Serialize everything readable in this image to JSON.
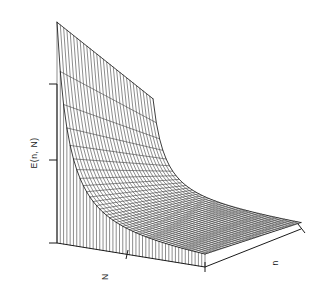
{
  "figure": {
    "title": "",
    "background_color": "#ffffff",
    "line_color": "#1a1a1a"
  },
  "labels": {
    "y_axis": "E(n, N)",
    "x_axis_left": "N",
    "x_axis_right": "n",
    "orientation_note": "rotated"
  },
  "chart_data": {
    "type": "line",
    "subtype": "3d-wireframe-surface",
    "title": "",
    "xlabel": "N",
    "ylabel": "E(n, N)",
    "zlabel": "n",
    "grid": false,
    "legend": "none",
    "axis_ticks": {
      "vertical_axis_ticks": 3,
      "N_axis_ticks": 3,
      "n_axis_ticks": 2
    },
    "surface_description": "Energy surface E(n, N) diverging steeply at small N and decaying to a flat valley at large N; monotone gentle variation along n.",
    "x": [
      1,
      2,
      3,
      4,
      5,
      6,
      7,
      8,
      9,
      10,
      11,
      12,
      13,
      14,
      15,
      16,
      17,
      18,
      19,
      20,
      21,
      22,
      23,
      24,
      25,
      26,
      27,
      28,
      29,
      30
    ],
    "z": [
      1,
      2,
      3,
      4,
      5,
      6,
      7,
      8,
      9,
      10,
      11,
      12,
      13,
      14,
      15,
      16,
      17,
      18,
      19,
      20
    ],
    "series": [
      {
        "name": "n=1",
        "values": [
          1.0,
          0.46,
          0.28,
          0.2,
          0.15,
          0.12,
          0.1,
          0.085,
          0.074,
          0.065,
          0.058,
          0.052,
          0.047,
          0.043,
          0.04,
          0.037,
          0.034,
          0.032,
          0.03,
          0.028,
          0.027,
          0.025,
          0.024,
          0.023,
          0.022,
          0.021,
          0.02,
          0.019,
          0.018,
          0.018
        ]
      },
      {
        "name": "n=5",
        "values": [
          0.86,
          0.4,
          0.24,
          0.17,
          0.13,
          0.105,
          0.087,
          0.074,
          0.064,
          0.056,
          0.05,
          0.045,
          0.041,
          0.037,
          0.034,
          0.032,
          0.03,
          0.028,
          0.026,
          0.024,
          0.023,
          0.022,
          0.021,
          0.02,
          0.019,
          0.018,
          0.017,
          0.017,
          0.016,
          0.015
        ]
      },
      {
        "name": "n=10",
        "values": [
          0.7,
          0.33,
          0.2,
          0.14,
          0.11,
          0.087,
          0.072,
          0.061,
          0.053,
          0.046,
          0.041,
          0.037,
          0.034,
          0.031,
          0.028,
          0.026,
          0.025,
          0.023,
          0.022,
          0.02,
          0.019,
          0.018,
          0.017,
          0.017,
          0.016,
          0.015,
          0.014,
          0.014,
          0.013,
          0.013
        ]
      },
      {
        "name": "n=15",
        "values": [
          0.55,
          0.26,
          0.16,
          0.11,
          0.086,
          0.069,
          0.057,
          0.049,
          0.042,
          0.037,
          0.033,
          0.03,
          0.027,
          0.025,
          0.023,
          0.021,
          0.02,
          0.018,
          0.017,
          0.016,
          0.015,
          0.015,
          0.014,
          0.013,
          0.013,
          0.012,
          0.012,
          0.011,
          0.011,
          0.01
        ]
      },
      {
        "name": "n=20",
        "values": [
          0.42,
          0.2,
          0.12,
          0.085,
          0.066,
          0.053,
          0.044,
          0.037,
          0.032,
          0.028,
          0.025,
          0.023,
          0.021,
          0.019,
          0.017,
          0.016,
          0.015,
          0.014,
          0.013,
          0.012,
          0.012,
          0.011,
          0.011,
          0.01,
          0.01,
          0.009,
          0.009,
          0.009,
          0.008,
          0.008
        ]
      }
    ]
  }
}
